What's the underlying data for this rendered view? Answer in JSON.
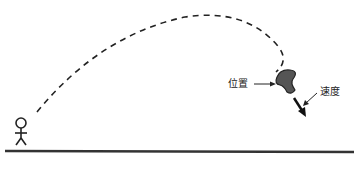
{
  "diagram": {
    "labels": {
      "position": "位置",
      "velocity": "速度"
    },
    "elements": [
      "stick-figure",
      "dashed-trajectory",
      "projectile",
      "velocity-arrow",
      "ground-line"
    ],
    "colors": {
      "stroke": "#222222",
      "projectile_fill": "#555555",
      "background": "#ffffff"
    }
  }
}
